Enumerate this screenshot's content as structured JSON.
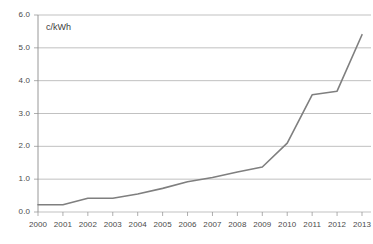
{
  "chart_data": {
    "type": "line",
    "title": "",
    "subtitle": "",
    "unit_label": "c/kWh",
    "xlabel": "",
    "ylabel": "",
    "categories": [
      "2000",
      "2001",
      "2002",
      "2003",
      "2004",
      "2005",
      "2006",
      "2007",
      "2008",
      "2009",
      "2010",
      "2011",
      "2012",
      "2013"
    ],
    "x": [
      2000,
      2001,
      2002,
      2003,
      2004,
      2005,
      2006,
      2007,
      2008,
      2009,
      2010,
      2011,
      2012,
      2013
    ],
    "values": [
      0.22,
      0.22,
      0.42,
      0.42,
      0.55,
      0.72,
      0.92,
      1.05,
      1.22,
      1.37,
      2.1,
      3.57,
      3.68,
      5.4
    ],
    "series": [
      {
        "name": "c/kWh",
        "values": [
          0.22,
          0.22,
          0.42,
          0.42,
          0.55,
          0.72,
          0.92,
          1.05,
          1.22,
          1.37,
          2.1,
          3.57,
          3.68,
          5.4
        ]
      }
    ],
    "ylim": [
      0.0,
      6.0
    ],
    "ytick_values": [
      0.0,
      1.0,
      2.0,
      3.0,
      4.0,
      5.0,
      6.0
    ],
    "ytick_labels": [
      "0.0",
      "1.0",
      "2.0",
      "3.0",
      "4.0",
      "5.0",
      "6.0"
    ],
    "xlim": [
      2000,
      2013
    ],
    "grid": true,
    "grid_axis": "y",
    "legend": false,
    "legend_position": "none",
    "markers": false,
    "annotations": []
  },
  "style": {
    "line_color": "#7f7f7f",
    "grid_color": "#a6a6a6",
    "axis_color": "#8c8c8c",
    "tick_text_color": "#4a4a4a",
    "background": "#ffffff"
  }
}
